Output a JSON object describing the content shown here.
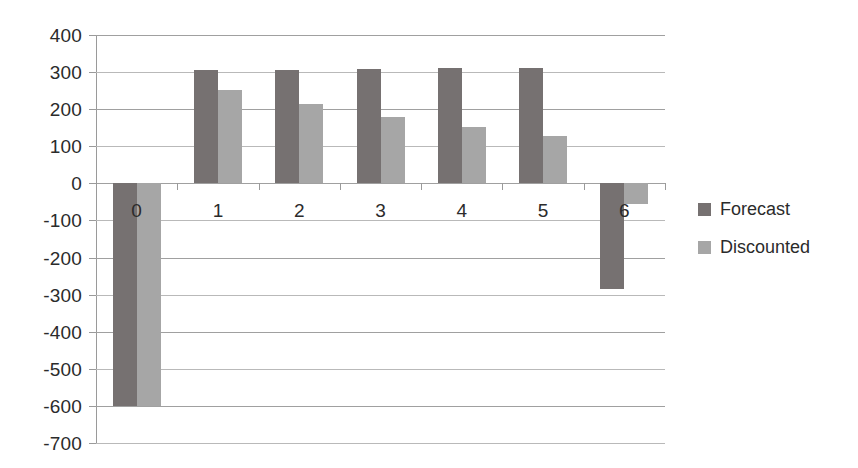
{
  "chart_data": {
    "type": "bar",
    "title": "",
    "subtitle": "",
    "xlabel": "",
    "ylabel": "",
    "categories": [
      "0",
      "1",
      "2",
      "3",
      "4",
      "5",
      "6"
    ],
    "series": [
      {
        "name": "Forecast",
        "color": "#767171",
        "values": [
          -600,
          305,
          305,
          307,
          310,
          312,
          -285
        ]
      },
      {
        "name": "Discounted",
        "color": "#a6a6a6",
        "values": [
          -600,
          252,
          213,
          180,
          152,
          128,
          -55
        ]
      }
    ],
    "ylim": [
      -700,
      400
    ],
    "ytick_step": 100,
    "ytick_labels": [
      "400",
      "300",
      "200",
      "100",
      "0",
      "-100",
      "-200",
      "-300",
      "-400",
      "-500",
      "-600",
      "-700"
    ],
    "ytick_values": [
      400,
      300,
      200,
      100,
      0,
      -100,
      -200,
      -300,
      -400,
      -500,
      -600,
      -700
    ],
    "grid": true,
    "grid_color": "#a0a0a0",
    "legend_position": "right",
    "legend": [
      {
        "label": "Forecast",
        "color": "#767171"
      },
      {
        "label": "Discounted",
        "color": "#a6a6a6"
      }
    ],
    "background_color": "#ffffff",
    "text_color": "#2b2b2b"
  }
}
